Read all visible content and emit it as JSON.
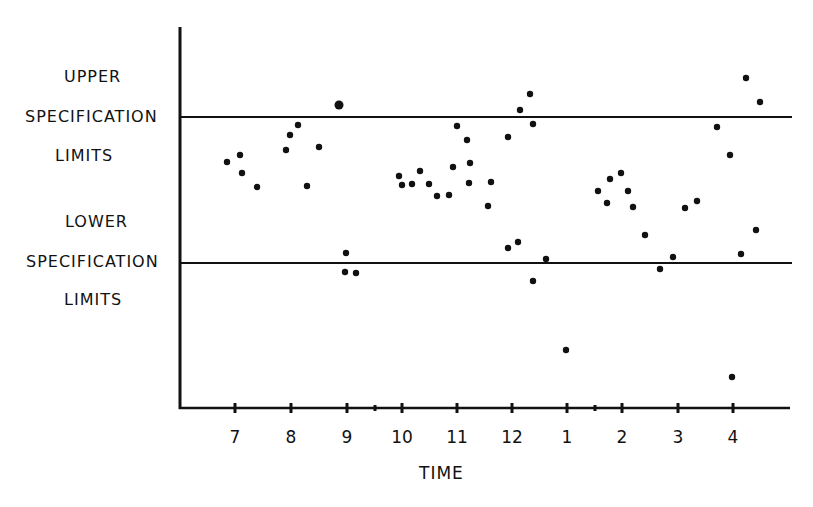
{
  "chart_data": {
    "type": "scatter",
    "title": "",
    "xlabel": "TIME",
    "ylabel": "",
    "x_ticks": [
      "7",
      "8",
      "9",
      "10",
      "11",
      "12",
      "1",
      "2",
      "3",
      "4"
    ],
    "grid": false,
    "reference_lines": [
      {
        "name": "UPPER SPECIFICATION LIMITS",
        "y_px": 117
      },
      {
        "name": "LOWER SPECIFICATION LIMITS",
        "y_px": 263
      }
    ],
    "annotations": [
      "UPPER",
      "SPECIFICATION",
      "LIMITS",
      "LOWER",
      "SPECIFICATION",
      "LIMITS"
    ],
    "points_px": [
      [
        227,
        162
      ],
      [
        240,
        155
      ],
      [
        242,
        173
      ],
      [
        257,
        187
      ],
      [
        286,
        150
      ],
      [
        290,
        135
      ],
      [
        298,
        125
      ],
      [
        307,
        186
      ],
      [
        319,
        147
      ],
      [
        339,
        105
      ],
      [
        346,
        253
      ],
      [
        345,
        272
      ],
      [
        356,
        273
      ],
      [
        399,
        176
      ],
      [
        402,
        185
      ],
      [
        412,
        184
      ],
      [
        420,
        171
      ],
      [
        429,
        184
      ],
      [
        437,
        196
      ],
      [
        449,
        195
      ],
      [
        453,
        167
      ],
      [
        457,
        126
      ],
      [
        467,
        140
      ],
      [
        470,
        163
      ],
      [
        469,
        183
      ],
      [
        488,
        206
      ],
      [
        491,
        182
      ],
      [
        508,
        137
      ],
      [
        520,
        110
      ],
      [
        530,
        94
      ],
      [
        533,
        124
      ],
      [
        508,
        248
      ],
      [
        518,
        242
      ],
      [
        546,
        259
      ],
      [
        533,
        281
      ],
      [
        566,
        350
      ],
      [
        598,
        191
      ],
      [
        607,
        203
      ],
      [
        610,
        179
      ],
      [
        621,
        173
      ],
      [
        628,
        191
      ],
      [
        633,
        207
      ],
      [
        645,
        235
      ],
      [
        660,
        269
      ],
      [
        673,
        257
      ],
      [
        685,
        208
      ],
      [
        697,
        201
      ],
      [
        717,
        127
      ],
      [
        730,
        155
      ],
      [
        746,
        78
      ],
      [
        760,
        102
      ],
      [
        756,
        230
      ],
      [
        741,
        254
      ],
      [
        732,
        377
      ]
    ]
  },
  "labels": {
    "usl": [
      "UPPER",
      "SPECIFICATION",
      "LIMITS"
    ],
    "lsl": [
      "LOWER",
      "SPECIFICATION",
      "LIMITS"
    ],
    "xlabel": "TIME"
  },
  "ticks": [
    {
      "label": "7",
      "x": 235
    },
    {
      "label": "8",
      "x": 291
    },
    {
      "label": "9",
      "x": 347
    },
    {
      "label": "10",
      "x": 402
    },
    {
      "label": "11",
      "x": 457
    },
    {
      "label": "12",
      "x": 512
    },
    {
      "label": "1",
      "x": 567
    },
    {
      "label": "2",
      "x": 622
    },
    {
      "label": "3",
      "x": 678
    },
    {
      "label": "4",
      "x": 733
    }
  ],
  "minor_ticks": [
    375,
    595
  ]
}
